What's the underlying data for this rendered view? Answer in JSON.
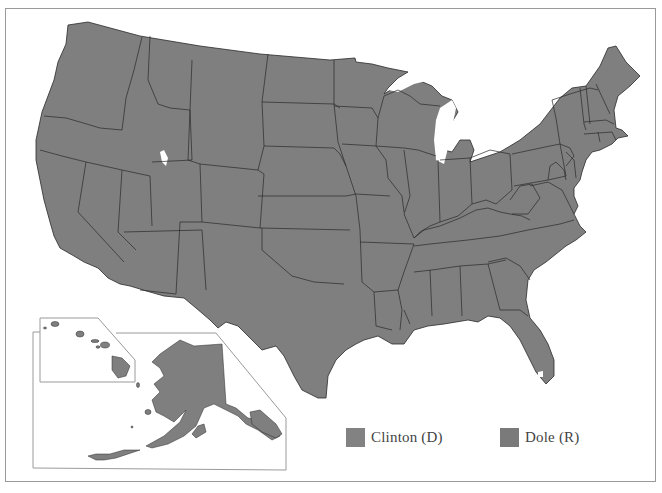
{
  "map": {
    "title": "1996 U.S. Presidential Election Results by State",
    "fill_color": "#7f7f7f",
    "border_color": "#2a2a2a",
    "frame_color": "#9a9a9a",
    "insets": [
      "Alaska",
      "Hawaii"
    ]
  },
  "legend": {
    "items": [
      {
        "label": "Clinton (D)",
        "color": "#828282"
      },
      {
        "label": "Dole (R)",
        "color": "#7a7a7a"
      }
    ]
  }
}
